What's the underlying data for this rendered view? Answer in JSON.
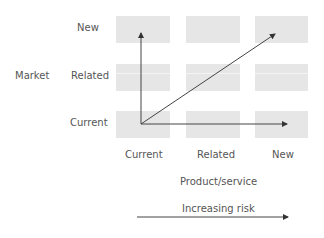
{
  "diagram": {
    "y_axis": {
      "title": "Market",
      "levels": [
        "New",
        "Related",
        "Current"
      ]
    },
    "x_axis": {
      "title": "Product/service",
      "levels": [
        "Current",
        "Related",
        "New"
      ]
    },
    "risk_arrow": {
      "label": "Increasing risk"
    },
    "arrows": [
      {
        "from": "Current/Current",
        "to": "New market, Current product",
        "direction": "up"
      },
      {
        "from": "Current/Current",
        "to": "New/New",
        "direction": "diagonal"
      },
      {
        "from": "Current/Current",
        "to": "Current market, New product",
        "direction": "right"
      }
    ],
    "colors": {
      "cell_fill": "#e6e6e6",
      "arrow": "#444444",
      "text": "#555555"
    }
  }
}
